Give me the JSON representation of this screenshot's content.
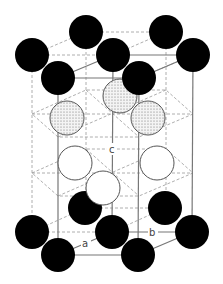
{
  "diagram": {
    "type": "crystal-structure",
    "axis_labels": {
      "a": "a",
      "b": "b",
      "c": "c"
    },
    "colors": {
      "black_atom": "#000000",
      "dotted_atom_fill": "#f2f2f2",
      "white_atom_fill": "#ffffff",
      "atom_outline": "#555555",
      "solid_line": "#777777",
      "dashed_line": "#999999"
    },
    "atoms": {
      "black_top": [
        {
          "x": 86,
          "y": 32
        },
        {
          "x": 166,
          "y": 32
        },
        {
          "x": 32,
          "y": 55
        },
        {
          "x": 113,
          "y": 55
        },
        {
          "x": 193,
          "y": 55
        },
        {
          "x": 58,
          "y": 78
        },
        {
          "x": 139,
          "y": 78
        }
      ],
      "black_bottom": [
        {
          "x": 85,
          "y": 208
        },
        {
          "x": 165,
          "y": 208
        },
        {
          "x": 32,
          "y": 232
        },
        {
          "x": 112,
          "y": 232
        },
        {
          "x": 192,
          "y": 232
        },
        {
          "x": 58,
          "y": 255
        },
        {
          "x": 138,
          "y": 255
        }
      ],
      "dotted": [
        {
          "x": 120,
          "y": 96
        },
        {
          "x": 67,
          "y": 118
        },
        {
          "x": 148,
          "y": 118
        }
      ],
      "white": [
        {
          "x": 75,
          "y": 163
        },
        {
          "x": 157,
          "y": 163
        },
        {
          "x": 103,
          "y": 188
        }
      ]
    }
  }
}
